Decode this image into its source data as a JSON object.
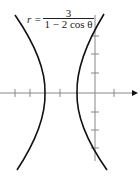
{
  "figure": {
    "equation": {
      "lhs": "r =",
      "numerator": "3",
      "denominator": "1 − 2 cos θ"
    },
    "axes": {
      "x_axis": {
        "y": 93,
        "x_start": 0,
        "x_end": 136,
        "arrow": true
      },
      "y_axis": {
        "x": 95,
        "y_start": 15,
        "y_end": 161
      },
      "x_ticks": [
        15,
        30,
        60,
        114
      ],
      "y_ticks": [
        36,
        54,
        73,
        112,
        130,
        148
      ]
    },
    "curves": [
      {
        "name": "left-branch",
        "top": [
          15,
          15
        ],
        "vertex": [
          45,
          93
        ],
        "bottom": [
          17,
          170
        ]
      },
      {
        "name": "right-branch",
        "top": [
          104,
          14
        ],
        "vertex": [
          77,
          93
        ],
        "bottom": [
          107,
          170
        ]
      }
    ],
    "colors": {
      "curve": "#111111",
      "axis": "#888888",
      "text": "#222222"
    }
  }
}
